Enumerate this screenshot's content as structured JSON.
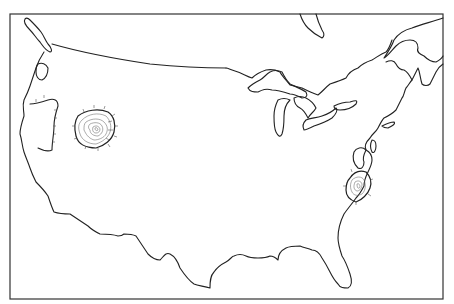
{
  "map": {
    "type": "outline map",
    "region": "Contiguous United States",
    "style": "black-and-white line drawing",
    "frame": {
      "x": 10,
      "y": 14,
      "width": 433,
      "height": 285
    },
    "colors": {
      "background": "#ffffff",
      "line": "#222222",
      "contour": "#666666"
    },
    "features": [
      {
        "id": "coastline-outline",
        "label": "US coastline and borders"
      },
      {
        "id": "great-lakes",
        "label": "Great Lakes"
      },
      {
        "id": "western-contour-cluster",
        "label": "Concentric contour cluster (Nevada/Utah area)"
      },
      {
        "id": "eastern-contour-cluster",
        "label": "Concentric contour cluster (Virginia/North Carolina area)"
      },
      {
        "id": "vancouver-island",
        "label": "Vancouver Island outline"
      },
      {
        "id": "hudson-bay-tip",
        "label": "Southern tip of James Bay"
      },
      {
        "id": "gulf-of-st-lawrence",
        "label": "Gulf of St. Lawrence coastline"
      }
    ]
  }
}
